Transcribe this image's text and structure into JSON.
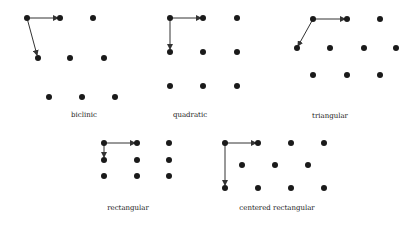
{
  "diagram": {
    "colors": {
      "point": "#1a1a1a",
      "arrow": "#333333",
      "background": "#ffffff"
    },
    "lattices": [
      {
        "name": "biclinic",
        "label": "biclinic",
        "label_pos": [
          84,
          117
        ],
        "points": [
          [
            27,
            18
          ],
          [
            60,
            18
          ],
          [
            93,
            18
          ],
          [
            38,
            58
          ],
          [
            70,
            58
          ],
          [
            104,
            58
          ],
          [
            49,
            97
          ],
          [
            82,
            97
          ],
          [
            115,
            97
          ]
        ],
        "arrows": [
          [
            27,
            18,
            58,
            18
          ],
          [
            27,
            18,
            37,
            55
          ]
        ]
      },
      {
        "name": "quadratic",
        "label": "quadratic",
        "label_pos": [
          190,
          117
        ],
        "points": [
          [
            170,
            18
          ],
          [
            203,
            18
          ],
          [
            237,
            18
          ],
          [
            170,
            52
          ],
          [
            203,
            52
          ],
          [
            237,
            52
          ],
          [
            170,
            86
          ],
          [
            203,
            86
          ],
          [
            237,
            86
          ]
        ],
        "arrows": [
          [
            170,
            18,
            201,
            18
          ],
          [
            170,
            18,
            170,
            49
          ]
        ]
      },
      {
        "name": "triangular",
        "label": "triangular",
        "label_pos": [
          330,
          118
        ],
        "points": [
          [
            313,
            19
          ],
          [
            347,
            19
          ],
          [
            380,
            19
          ],
          [
            297,
            48
          ],
          [
            330,
            48
          ],
          [
            364,
            48
          ],
          [
            396,
            48
          ],
          [
            313,
            75
          ],
          [
            347,
            75
          ],
          [
            380,
            75
          ]
        ],
        "arrows": [
          [
            313,
            19,
            345,
            19
          ],
          [
            313,
            19,
            298,
            46
          ]
        ]
      },
      {
        "name": "rectangular",
        "label": "rectangular",
        "label_pos": [
          128,
          210
        ],
        "points": [
          [
            104,
            143
          ],
          [
            137,
            143
          ],
          [
            169,
            143
          ],
          [
            104,
            160
          ],
          [
            137,
            160
          ],
          [
            169,
            160
          ],
          [
            104,
            176
          ],
          [
            137,
            176
          ],
          [
            169,
            176
          ]
        ],
        "arrows": [
          [
            104,
            143,
            135,
            143
          ],
          [
            104,
            143,
            104,
            157
          ]
        ]
      },
      {
        "name": "centered-rectangular",
        "label": "centered rectangular",
        "label_pos": [
          277,
          210
        ],
        "points": [
          [
            225,
            143
          ],
          [
            258,
            143
          ],
          [
            291,
            143
          ],
          [
            324,
            143
          ],
          [
            242,
            165
          ],
          [
            275,
            165
          ],
          [
            308,
            165
          ],
          [
            225,
            188
          ],
          [
            258,
            188
          ],
          [
            291,
            188
          ],
          [
            324,
            188
          ]
        ],
        "arrows": [
          [
            225,
            143,
            256,
            143
          ],
          [
            225,
            143,
            225,
            185
          ]
        ]
      }
    ]
  }
}
